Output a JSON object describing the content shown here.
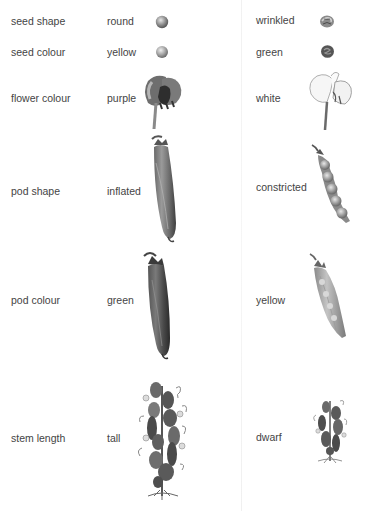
{
  "columns": {
    "trait": "trait",
    "dominant": "dominant",
    "recessive": "recessive"
  },
  "traits": [
    {
      "name": "seed shape",
      "dominant": "round",
      "recessive": "wrinkled",
      "dominant_icon": "round-seed-icon",
      "recessive_icon": "wrinkled-seed-icon"
    },
    {
      "name": "seed colour",
      "dominant": "yellow",
      "recessive": "green",
      "dominant_icon": "yellow-seed-icon",
      "recessive_icon": "green-seed-icon"
    },
    {
      "name": "flower colour",
      "dominant": "purple",
      "recessive": "white",
      "dominant_icon": "purple-flower-icon",
      "recessive_icon": "white-flower-icon"
    },
    {
      "name": "pod shape",
      "dominant": "inflated",
      "recessive": "constricted",
      "dominant_icon": "inflated-pod-icon",
      "recessive_icon": "constricted-pod-icon"
    },
    {
      "name": "pod colour",
      "dominant": "green",
      "recessive": "yellow",
      "dominant_icon": "green-pod-icon",
      "recessive_icon": "yellow-pod-icon"
    },
    {
      "name": "stem length",
      "dominant": "tall",
      "recessive": "dwarf",
      "dominant_icon": "tall-plant-icon",
      "recessive_icon": "dwarf-plant-icon"
    }
  ],
  "colors": {
    "text": "#444444",
    "ink_dark": "#3a3a3a",
    "ink_mid": "#7a7a7a",
    "ink_light": "#c8c8c8",
    "background": "#ffffff"
  }
}
